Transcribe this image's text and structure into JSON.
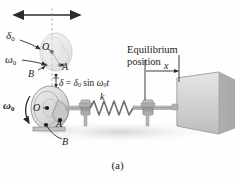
{
  "figure": {
    "caption": "(a)",
    "type": "mechanics-diagram"
  },
  "labels": {
    "delta0": "δ",
    "delta0_sub": "0",
    "omega0_top": "ω",
    "omega0_top_sub": "0",
    "omega0_bot": "ω",
    "omega0_bot_sub": "0",
    "point_O_top": "O",
    "point_A_top": "A",
    "point_B_top": "B",
    "point_O_bot": "O",
    "point_A_bot": "A",
    "point_B_bot": "B",
    "spring_constant": "k",
    "x_dimension": "x",
    "equilibrium_line1": "Equilibrium",
    "equilibrium_line2": "position"
  },
  "equation": {
    "lhs": "δ",
    "equals": "=",
    "amplitude": "δ",
    "amplitude_sub": "0",
    "trig": "sin",
    "omega": "ω",
    "omega_sub": "0",
    "time": "t",
    "full_text": "δ = δ0 sin ω0t"
  },
  "colors": {
    "background": "#fefefe",
    "ink": "#1a1a1a",
    "line": "#2b2b2b",
    "block_light": "#dcdcdc",
    "block_mid": "#c9c9c9",
    "block_dark": "#b4b4b4",
    "disk_light": "#e4e4e4",
    "disk_mid": "#cfcfcf",
    "shadow": "#e8e8e8",
    "metal": "#9a9a9a",
    "spring": "#7a7a7a"
  }
}
